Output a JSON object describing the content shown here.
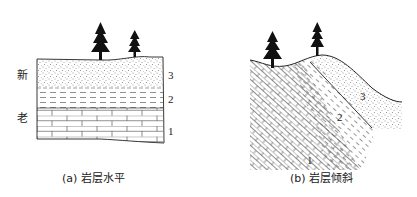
{
  "figure": {
    "panel_a": {
      "caption_letter": "(a)",
      "caption_text": "岩层水平",
      "age_labels": {
        "young": "新",
        "old": "老"
      },
      "layer_labels": [
        "3",
        "2",
        "1"
      ],
      "layers": [
        {
          "id": "3",
          "pattern": "sandstone-dots"
        },
        {
          "id": "2",
          "pattern": "shale-dashes"
        },
        {
          "id": "1",
          "pattern": "limestone-bricks"
        }
      ],
      "trees": 2
    },
    "panel_b": {
      "caption_letter": "(b)",
      "caption_text": "岩层倾斜",
      "layer_labels": [
        "3",
        "2",
        "1"
      ],
      "layers": [
        {
          "id": "3",
          "pattern": "sandstone-dots"
        },
        {
          "id": "2",
          "pattern": "shale-dashes"
        },
        {
          "id": "1",
          "pattern": "limestone-bricks"
        }
      ],
      "trees": 2
    },
    "colors": {
      "ink": "#1a1a1a",
      "background": "#ffffff"
    }
  }
}
